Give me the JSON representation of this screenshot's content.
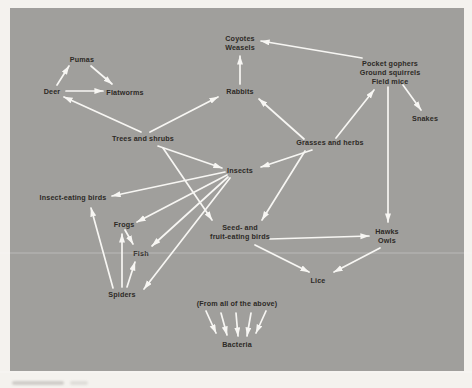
{
  "colors": {
    "page_bg": "#f4f2ee",
    "panel_bg": "#a09f9c",
    "label_text": "#2d2a26",
    "arrow": "#f7f6f3"
  },
  "diagram": {
    "type": "food-web",
    "nodes": [
      {
        "id": "pumas",
        "lines": [
          "Pumas"
        ],
        "x": 82,
        "y": 59
      },
      {
        "id": "deer",
        "lines": [
          "Deer"
        ],
        "x": 52,
        "y": 91
      },
      {
        "id": "flatworms",
        "lines": [
          "Flatworms"
        ],
        "x": 125,
        "y": 92
      },
      {
        "id": "coyotes-weasels",
        "lines": [
          "Coyotes",
          "Weasels"
        ],
        "x": 240,
        "y": 43
      },
      {
        "id": "rabbits",
        "lines": [
          "Rabbits"
        ],
        "x": 240,
        "y": 91
      },
      {
        "id": "rodents",
        "lines": [
          "Pocket gophers",
          "Ground squirrels",
          "Field mice"
        ],
        "x": 390,
        "y": 72
      },
      {
        "id": "snakes",
        "lines": [
          "Snakes"
        ],
        "x": 425,
        "y": 118
      },
      {
        "id": "trees-and-shrubs",
        "lines": [
          "Trees and shrubs"
        ],
        "x": 143,
        "y": 138
      },
      {
        "id": "grasses-and-herbs",
        "lines": [
          "Grasses and herbs"
        ],
        "x": 330,
        "y": 142
      },
      {
        "id": "insects",
        "lines": [
          "Insects"
        ],
        "x": 240,
        "y": 170
      },
      {
        "id": "insect-eating-birds",
        "lines": [
          "Insect-eating birds"
        ],
        "x": 73,
        "y": 197
      },
      {
        "id": "frogs",
        "lines": [
          "Frogs"
        ],
        "x": 124,
        "y": 224
      },
      {
        "id": "fish",
        "lines": [
          "Fish"
        ],
        "x": 141,
        "y": 253
      },
      {
        "id": "seed-fruit-eating-birds",
        "lines": [
          "Seed- and",
          "fruit-eating birds"
        ],
        "x": 240,
        "y": 232
      },
      {
        "id": "hawks-owls",
        "lines": [
          "Hawks",
          "Owls"
        ],
        "x": 387,
        "y": 236
      },
      {
        "id": "lice",
        "lines": [
          "Lice"
        ],
        "x": 318,
        "y": 280
      },
      {
        "id": "spiders",
        "lines": [
          "Spiders"
        ],
        "x": 122,
        "y": 294
      },
      {
        "id": "from-all-of-the-above",
        "lines": [
          "(From all of the above)"
        ],
        "x": 237,
        "y": 303
      },
      {
        "id": "bacteria",
        "lines": [
          "Bacteria"
        ],
        "x": 237,
        "y": 344
      }
    ],
    "edges": [
      {
        "from": "deer",
        "to": "pumas",
        "x1": 57,
        "y1": 85,
        "x2": 69,
        "y2": 66
      },
      {
        "from": "pumas",
        "to": "flatworms",
        "x1": 91,
        "y1": 66,
        "x2": 112,
        "y2": 84
      },
      {
        "from": "deer",
        "to": "flatworms",
        "x1": 66,
        "y1": 91,
        "x2": 103,
        "y2": 91
      },
      {
        "from": "trees-and-shrubs",
        "to": "deer",
        "x1": 141,
        "y1": 132,
        "x2": 64,
        "y2": 97
      },
      {
        "from": "trees-and-shrubs",
        "to": "rabbits",
        "x1": 150,
        "y1": 132,
        "x2": 218,
        "y2": 97
      },
      {
        "from": "rabbits",
        "to": "coyotes-weasels",
        "x1": 240,
        "y1": 84,
        "x2": 240,
        "y2": 56
      },
      {
        "from": "rodents",
        "to": "coyotes-weasels",
        "x1": 362,
        "y1": 58,
        "x2": 261,
        "y2": 41
      },
      {
        "from": "grasses-and-herbs",
        "to": "rabbits",
        "x1": 304,
        "y1": 139,
        "x2": 259,
        "y2": 99
      },
      {
        "from": "grasses-and-herbs",
        "to": "rodents",
        "x1": 336,
        "y1": 138,
        "x2": 374,
        "y2": 90
      },
      {
        "from": "rodents",
        "to": "snakes",
        "x1": 403,
        "y1": 85,
        "x2": 421,
        "y2": 110
      },
      {
        "from": "rodents",
        "to": "hawks-owls",
        "x1": 388,
        "y1": 87,
        "x2": 388,
        "y2": 222
      },
      {
        "from": "trees-and-shrubs",
        "to": "insects",
        "x1": 158,
        "y1": 146,
        "x2": 222,
        "y2": 168
      },
      {
        "from": "grasses-and-herbs",
        "to": "insects",
        "x1": 312,
        "y1": 150,
        "x2": 261,
        "y2": 167
      },
      {
        "from": "trees-and-shrubs",
        "to": "seed-fruit-eating-birds",
        "x1": 163,
        "y1": 148,
        "x2": 212,
        "y2": 220
      },
      {
        "from": "grasses-and-herbs",
        "to": "seed-fruit-eating-birds",
        "x1": 305,
        "y1": 151,
        "x2": 262,
        "y2": 220
      },
      {
        "from": "insects",
        "to": "insect-eating-birds",
        "x1": 225,
        "y1": 172,
        "x2": 112,
        "y2": 196
      },
      {
        "from": "insects",
        "to": "frogs",
        "x1": 227,
        "y1": 175,
        "x2": 137,
        "y2": 222
      },
      {
        "from": "insects",
        "to": "fish",
        "x1": 228,
        "y1": 177,
        "x2": 152,
        "y2": 246
      },
      {
        "from": "insects",
        "to": "spiders",
        "x1": 230,
        "y1": 178,
        "x2": 144,
        "y2": 289
      },
      {
        "from": "frogs",
        "to": "fish",
        "x1": 125,
        "y1": 230,
        "x2": 133,
        "y2": 244
      },
      {
        "from": "spiders",
        "to": "frogs",
        "x1": 122,
        "y1": 287,
        "x2": 122,
        "y2": 234
      },
      {
        "from": "spiders",
        "to": "fish",
        "x1": 127,
        "y1": 287,
        "x2": 135,
        "y2": 262
      },
      {
        "from": "spiders",
        "to": "insect-eating-birds",
        "x1": 113,
        "y1": 288,
        "x2": 91,
        "y2": 208
      },
      {
        "from": "seed-fruit-eating-birds",
        "to": "hawks-owls",
        "x1": 270,
        "y1": 239,
        "x2": 369,
        "y2": 236
      },
      {
        "from": "seed-fruit-eating-birds",
        "to": "lice",
        "x1": 255,
        "y1": 245,
        "x2": 309,
        "y2": 272
      },
      {
        "from": "hawks-owls",
        "to": "lice",
        "x1": 380,
        "y1": 248,
        "x2": 334,
        "y2": 272
      },
      {
        "from": "from-all-of-the-above",
        "to": "bacteria",
        "x1": 206,
        "y1": 311,
        "x2": 216,
        "y2": 333
      },
      {
        "from": "from-all-of-the-above",
        "to": "bacteria",
        "x1": 221,
        "y1": 313,
        "x2": 227,
        "y2": 335
      },
      {
        "from": "from-all-of-the-above",
        "to": "bacteria",
        "x1": 236,
        "y1": 313,
        "x2": 238,
        "y2": 336
      },
      {
        "from": "from-all-of-the-above",
        "to": "bacteria",
        "x1": 251,
        "y1": 313,
        "x2": 247,
        "y2": 336
      },
      {
        "from": "from-all-of-the-above",
        "to": "bacteria",
        "x1": 266,
        "y1": 311,
        "x2": 256,
        "y2": 333
      }
    ]
  }
}
